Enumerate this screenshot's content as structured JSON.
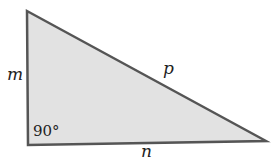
{
  "diagram": {
    "type": "right-triangle",
    "vertices": {
      "top": [
        27,
        11
      ],
      "bottom_left": [
        28,
        145
      ],
      "bottom_right": [
        266,
        141
      ]
    },
    "fill_color": "#e2e2e2",
    "stroke_color": "#555555",
    "labels": {
      "vertical_side": "m",
      "hypotenuse": "p",
      "base": "n",
      "right_angle": "90°"
    }
  }
}
